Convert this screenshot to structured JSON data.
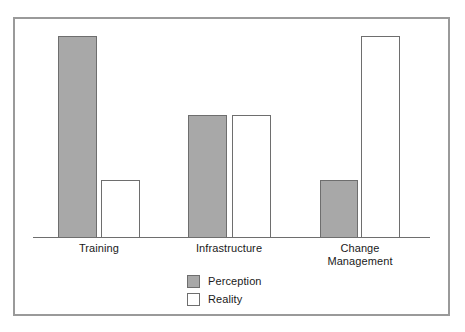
{
  "figure": {
    "background_color": "#ffffff",
    "frame_color": "#9a9a9a"
  },
  "chart_data": {
    "type": "bar",
    "title": "",
    "subtitle": "",
    "xlabel": "",
    "ylabel": "",
    "categories": [
      "Training",
      "Infrastructure",
      "Change\nManagement"
    ],
    "series": [
      {
        "name": "Perception",
        "color": "#a8a8a8",
        "values": [
          100,
          61,
          28
        ]
      },
      {
        "name": "Reality",
        "color": "#ffffff",
        "values": [
          28,
          61,
          100
        ]
      }
    ],
    "ylim": [
      0,
      100
    ],
    "grid": false,
    "y_axis_visible": false,
    "y_ticks": [],
    "x_axis_visible": true,
    "legend": {
      "position": "bottom-center",
      "entries": [
        {
          "label": "Perception",
          "swatch": "filled-gray-square"
        },
        {
          "label": "Reality",
          "swatch": "outlined-white-square"
        }
      ]
    },
    "annotations": []
  },
  "bars": [
    {
      "name": "bar-training-perception",
      "series": "Perception",
      "category": "Training",
      "value": 100,
      "left": 58,
      "top": 36,
      "width": 39,
      "height": 202
    },
    {
      "name": "bar-training-reality",
      "series": "Reality",
      "category": "Training",
      "value": 28,
      "left": 101,
      "top": 180,
      "width": 39,
      "height": 58
    },
    {
      "name": "bar-infrastructure-perception",
      "series": "Perception",
      "category": "Infrastructure",
      "value": 61,
      "left": 188,
      "top": 115,
      "width": 39,
      "height": 123
    },
    {
      "name": "bar-infrastructure-reality",
      "series": "Reality",
      "category": "Infrastructure",
      "value": 61,
      "left": 232,
      "top": 115,
      "width": 39,
      "height": 123
    },
    {
      "name": "bar-change-management-perception",
      "series": "Perception",
      "category": "Change Management",
      "value": 28,
      "left": 320,
      "top": 180,
      "width": 38,
      "height": 58
    },
    {
      "name": "bar-change-management-reality",
      "series": "Reality",
      "category": "Change Management",
      "value": 100,
      "left": 361,
      "top": 36,
      "width": 39,
      "height": 202
    }
  ],
  "category_labels": [
    {
      "text": "Training",
      "left": 49,
      "top": 242,
      "width": 100
    },
    {
      "text": "Infrastructure",
      "left": 179,
      "top": 242,
      "width": 100
    },
    {
      "text": "Change\nManagement",
      "left": 310,
      "top": 242,
      "width": 100
    }
  ],
  "legend_rows": [
    {
      "label": "Perception",
      "swatch_class": "perception"
    },
    {
      "label": "Reality",
      "swatch_class": "reality"
    }
  ]
}
